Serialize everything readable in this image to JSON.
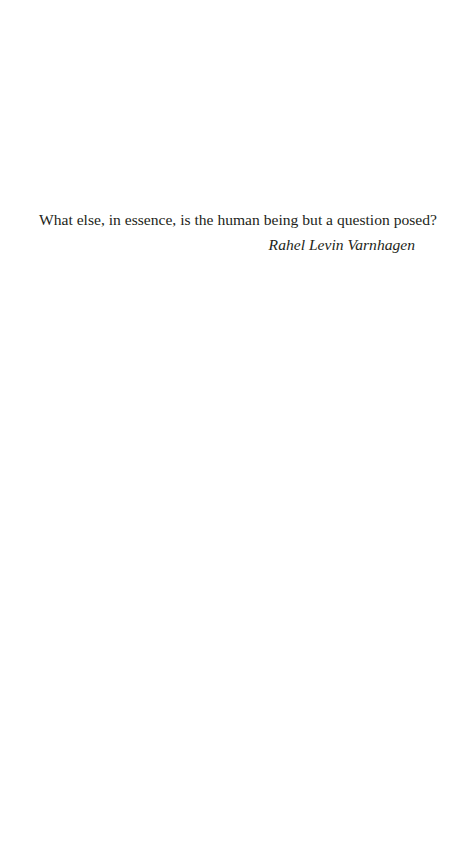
{
  "epigraph": {
    "quote": "What else, in essence, is the human being but a question posed?",
    "attribution": "Rahel Levin Varnhagen"
  },
  "colors": {
    "background": "#ffffff",
    "text": "#231f20"
  }
}
